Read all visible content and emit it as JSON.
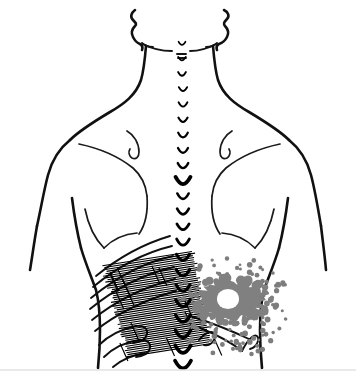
{
  "figure": {
    "caption": "",
    "background_color": "#ffffff",
    "ink_color": "#111111"
  },
  "anatomy": {
    "regions": [
      {
        "id": "head-jaw",
        "label": "Jaw and ear outline"
      },
      {
        "id": "neck",
        "label": "Neck"
      },
      {
        "id": "left-shoulder",
        "label": "Left shoulder"
      },
      {
        "id": "right-shoulder",
        "label": "Right shoulder"
      },
      {
        "id": "left-scapula",
        "label": "Left scapula"
      },
      {
        "id": "right-scapula",
        "label": "Right scapula"
      },
      {
        "id": "left-arm",
        "label": "Left arm"
      },
      {
        "id": "right-arm",
        "label": "Right arm"
      },
      {
        "id": "lower-back",
        "label": "Lumbar region"
      },
      {
        "id": "iliac-crest",
        "label": "Iliac crest"
      }
    ]
  },
  "spine": {
    "label": "Vertebral column midline",
    "marker_glyph": "u-shaped-vertebra",
    "count": 22,
    "top_y": 44,
    "bottom_y": 366,
    "x": 183,
    "min_width": 7,
    "max_width": 16,
    "emphasized_index": 9,
    "color": "#000000"
  },
  "pain_markings": {
    "hatched_zone": {
      "name": "essential-pain-zone-hatched",
      "side": "left",
      "pattern": "dense-cross-hatch",
      "color": "#000000",
      "center_x": 148,
      "center_y": 306,
      "width": 96,
      "height": 95,
      "line_count": 46,
      "skew_deg": -9
    },
    "solid_blob": {
      "name": "essential-pain-zone-solid",
      "side": "right",
      "pattern": "solid-gray-irregular",
      "fill_color": "#808080",
      "core_color": "#ffffff",
      "center_x": 231,
      "center_y": 300,
      "radius_x": 34,
      "radius_y": 20,
      "core_radius": 11
    },
    "stipple_zone": {
      "name": "spillover-pain-zone-stippled",
      "side": "right",
      "pattern": "stippled-dots",
      "dot_color": "#7d7d7d",
      "center_x": 234,
      "center_y": 308,
      "radius_x": 58,
      "radius_y": 52,
      "dot_count": 150,
      "dot_radius_min": 1.4,
      "dot_radius_max": 2.9
    }
  },
  "legend": {
    "hatched_meaning": "Essential pain area (solid hatching)",
    "stipple_meaning": "Spillover pain area (stippling)"
  },
  "footer": {
    "rule_y": 370,
    "rule_color": "#e2e2e2"
  }
}
